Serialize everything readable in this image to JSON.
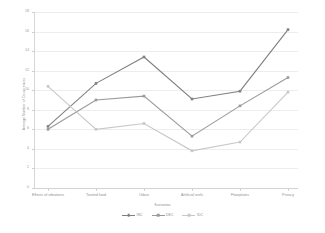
{
  "chart_data": {
    "type": "line",
    "title": "",
    "xlabel": "Scenarios",
    "ylabel": "Average Number of Occurrences",
    "ylim": [
      0,
      18
    ],
    "ytick_step": 2,
    "yticks": [
      0,
      2,
      4,
      6,
      8,
      10,
      12,
      14,
      16,
      18
    ],
    "grid": true,
    "legend_position": "bottom-center",
    "categories": [
      "Effects of vibrations",
      "Tainted food",
      "Odour",
      "Artificial reefs",
      "Floorplates",
      "Privacy"
    ],
    "series": [
      {
        "name": "INC",
        "color": "#808080",
        "values": [
          6.3,
          10.7,
          13.4,
          9.1,
          9.9,
          16.2
        ]
      },
      {
        "name": "DEC",
        "color": "#9a9a9a",
        "values": [
          6.0,
          9.0,
          9.4,
          5.3,
          8.4,
          11.3
        ]
      },
      {
        "name": "IDC",
        "color": "#c8c8c8",
        "values": [
          10.4,
          6.0,
          6.6,
          3.8,
          4.7,
          9.8
        ]
      }
    ]
  },
  "colors": {
    "gridline": "#ededed",
    "axis": "#d3d3d3",
    "text": "#8f8f8f",
    "background": "#ffffff"
  }
}
